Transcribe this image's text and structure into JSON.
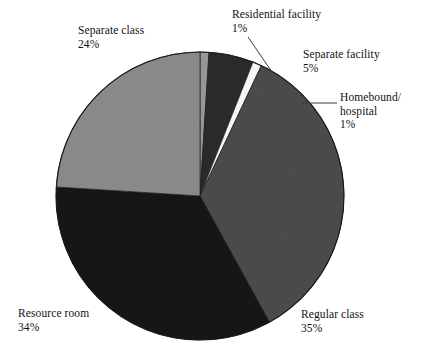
{
  "chart_data": {
    "type": "pie",
    "title": "",
    "subtitle": "",
    "xlabel": "",
    "ylabel": "",
    "legend_position": "none",
    "grid": false,
    "units": "percent",
    "start_angle_deg": 0,
    "direction": "clockwise",
    "categories": [
      "Residential facility",
      "Separate facility",
      "Homebound/ hospital",
      "Regular class",
      "Resource room",
      "Separate class"
    ],
    "values": [
      1,
      5,
      1,
      35,
      34,
      24
    ],
    "slices": [
      {
        "name": "Residential facility",
        "label_line1": "Residential facility",
        "label_line2": "1%",
        "value": 1,
        "percent_text": "1%",
        "color": "#9a9a9a",
        "leader_line": true
      },
      {
        "name": "Separate facility",
        "label_line1": "Separate facility",
        "label_line2": "5%",
        "value": 5,
        "percent_text": "5%",
        "color": "#2c2c2c",
        "leader_line": false
      },
      {
        "name": "Homebound/ hospital",
        "label_line1": "Homebound/",
        "label_line1b": "hospital",
        "label_line2": "1%",
        "value": 1,
        "percent_text": "1%",
        "color": "#fbfbfb",
        "leader_line": true
      },
      {
        "name": "Regular class",
        "label_line1": "Regular class",
        "label_line2": "35%",
        "value": 35,
        "percent_text": "35%",
        "color": "#4c4c4c",
        "leader_line": false
      },
      {
        "name": "Resource room",
        "label_line1": "Resource room",
        "label_line2": "34%",
        "value": 34,
        "percent_text": "34%",
        "color": "#141414",
        "leader_line": false
      },
      {
        "name": "Separate class",
        "label_line1": "Separate class",
        "label_line2": "24%",
        "value": 24,
        "percent_text": "24%",
        "color": "#8c8c8c",
        "leader_line": false
      }
    ]
  },
  "labels": {
    "separate_class": {
      "name": "Separate class",
      "percent": "24%"
    },
    "residential_facility": {
      "name": "Residential facility",
      "percent": "1%"
    },
    "separate_facility": {
      "name": "Separate facility",
      "percent": "5%"
    },
    "homebound": {
      "name": "Homebound/",
      "name2": "hospital",
      "percent": "1%"
    },
    "regular_class": {
      "name": "Regular class",
      "percent": "35%"
    },
    "resource_room": {
      "name": "Resource room",
      "percent": "34%"
    }
  },
  "colors": {
    "background": "#ffffff",
    "text": "#111111",
    "outline": "#1a1a1a",
    "leader": "#3a3a3a"
  }
}
